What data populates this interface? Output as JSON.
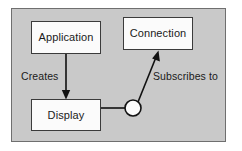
{
  "diagram": {
    "type": "uml-component-diagram",
    "background_color": "#c9c9c9",
    "page_color": "#ffffff",
    "frame_border_color": "#6f6f6f",
    "node_fill_color": "#fbfbfb",
    "node_border_color": "#3b3b3b",
    "connector_color": "#111111",
    "nodes": [
      {
        "id": "application",
        "label": "Application"
      },
      {
        "id": "connection",
        "label": "Connection"
      },
      {
        "id": "display",
        "label": "Display"
      }
    ],
    "edges": [
      {
        "id": "creates",
        "label": "Creates",
        "from": "application",
        "to": "display",
        "arrow": "open-arrow-down"
      },
      {
        "id": "subscribes-to",
        "label": "Subscribes to",
        "from": "display-interface-socket",
        "to": "connection",
        "arrow": "open-arrow-diagonal"
      }
    ],
    "interface_symbol": {
      "id": "display-interface-socket",
      "shape": "circle",
      "fill": "#fbfbfb",
      "stroke": "#111111"
    }
  }
}
